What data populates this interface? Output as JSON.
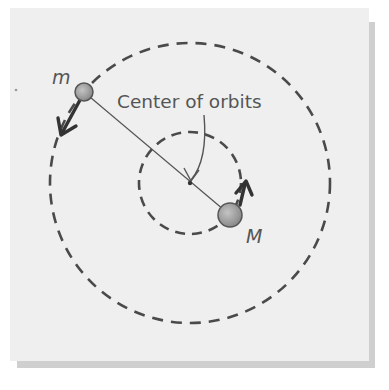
{
  "diagram": {
    "labels": {
      "small_mass": "m",
      "large_mass": "M",
      "center": "Center of orbits"
    },
    "colors": {
      "panel_background": "#efefef",
      "panel_shadow": "#cfcfcf",
      "line": "#4a4a4a",
      "mass_fill": "#9a9a9a",
      "mass_stroke": "#555555",
      "text": "#555555"
    },
    "elements": {
      "outer_orbit": {
        "shape": "dashed-circle",
        "center": [
          190,
          183
        ],
        "radius": 140
      },
      "inner_orbit": {
        "shape": "dashed-circle",
        "center": [
          190,
          183
        ],
        "radius": 51
      },
      "small_mass_body": {
        "position": [
          84,
          92
        ],
        "radius": 9
      },
      "large_mass_body": {
        "position": [
          230,
          215
        ],
        "radius": 12
      },
      "connecting_line": {
        "from": [
          84,
          92
        ],
        "to": [
          230,
          215
        ]
      },
      "center_point": {
        "position": [
          190,
          183
        ]
      },
      "velocity_arrow_m": {
        "direction": "down-left"
      },
      "velocity_arrow_M": {
        "direction": "up"
      }
    }
  }
}
